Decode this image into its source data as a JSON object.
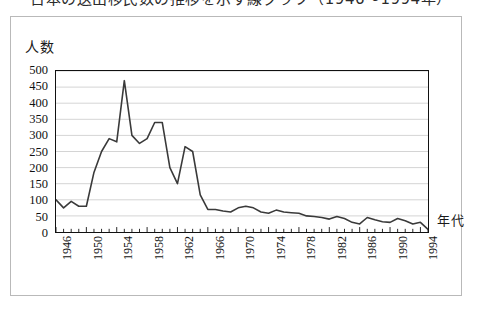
{
  "document": {
    "title_clipped": "日本の送出移民数の推移を示す線グラフ（1946～1994年）",
    "frame_color": "#b9b9b9",
    "background": "#ffffff"
  },
  "axes": {
    "y_caption": "人数",
    "x_caption": "年代",
    "y_ticks": [
      "500",
      "450",
      "400",
      "350",
      "300",
      "250",
      "200",
      "150",
      "100",
      "50",
      "0"
    ],
    "x_ticks": [
      "1946",
      "1950",
      "1954",
      "1958",
      "1962",
      "1966",
      "1970",
      "1974",
      "1978",
      "1982",
      "1986",
      "1990",
      "1994"
    ],
    "line_color": "#3a3a3a",
    "grid_color": "#c8c8c8",
    "axis_color": "#111111"
  },
  "chart_data": {
    "type": "line",
    "xlabel": "年代",
    "ylabel": "人数",
    "xlim": [
      1946,
      1995
    ],
    "ylim": [
      0,
      500
    ],
    "ytick_step": 50,
    "xtick_step": 1,
    "xtick_label_step": 4,
    "grid": true,
    "legend": false,
    "x": [
      1946,
      1947,
      1948,
      1949,
      1950,
      1951,
      1952,
      1953,
      1954,
      1955,
      1956,
      1957,
      1958,
      1959,
      1960,
      1961,
      1962,
      1963,
      1964,
      1965,
      1966,
      1967,
      1968,
      1969,
      1970,
      1971,
      1972,
      1973,
      1974,
      1975,
      1976,
      1977,
      1978,
      1979,
      1980,
      1981,
      1982,
      1983,
      1984,
      1985,
      1986,
      1987,
      1988,
      1989,
      1990,
      1991,
      1992,
      1993,
      1994,
      1995
    ],
    "values": [
      100,
      75,
      95,
      80,
      80,
      185,
      250,
      290,
      280,
      470,
      300,
      275,
      290,
      340,
      340,
      200,
      150,
      265,
      250,
      115,
      70,
      70,
      65,
      62,
      75,
      80,
      75,
      62,
      58,
      68,
      62,
      60,
      58,
      50,
      48,
      45,
      40,
      48,
      42,
      30,
      25,
      45,
      38,
      32,
      30,
      42,
      35,
      25,
      30,
      8
    ],
    "series": [
      {
        "name": "人数",
        "values": [
          100,
          75,
          95,
          80,
          80,
          185,
          250,
          290,
          280,
          470,
          300,
          275,
          290,
          340,
          340,
          200,
          150,
          265,
          250,
          115,
          70,
          70,
          65,
          62,
          75,
          80,
          75,
          62,
          58,
          68,
          62,
          60,
          58,
          50,
          48,
          45,
          40,
          48,
          42,
          30,
          25,
          45,
          38,
          32,
          30,
          42,
          35,
          25,
          30,
          8
        ],
        "color": "#3a3a3a"
      }
    ]
  }
}
